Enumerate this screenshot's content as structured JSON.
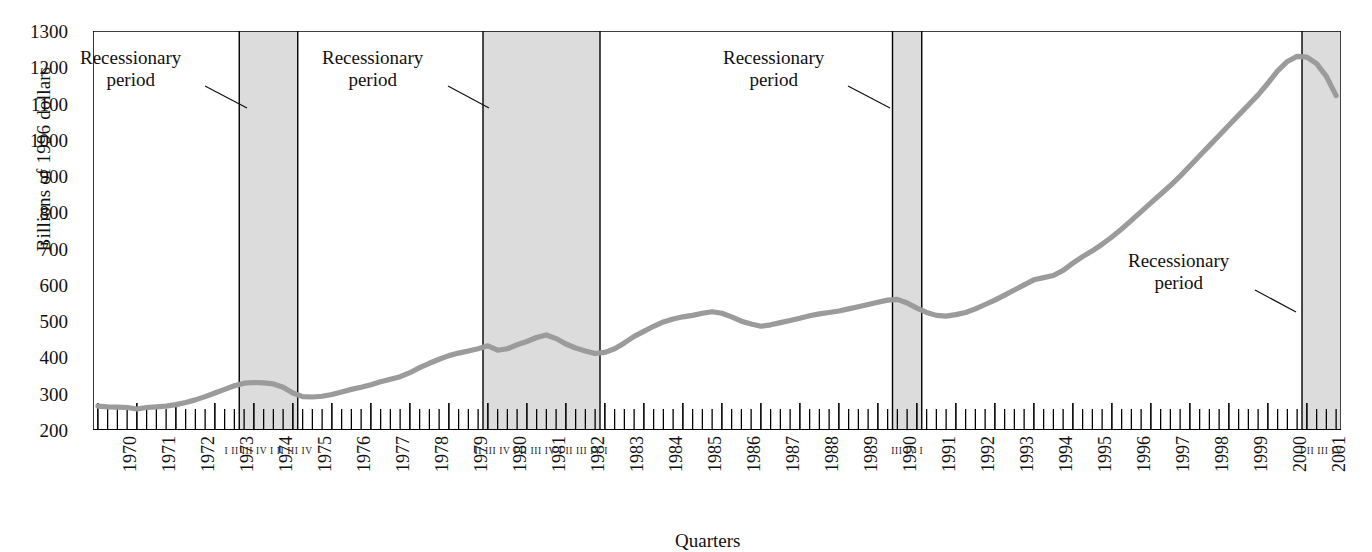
{
  "figure": {
    "cropped_header_text": "",
    "xlabel": "Quarters",
    "ylabel": "Billions of 1996 dollars"
  },
  "annotations": [
    {
      "id": "a1",
      "line1": "Recessionary",
      "line2": "period"
    },
    {
      "id": "a2",
      "line1": "Recessionary",
      "line2": "period"
    },
    {
      "id": "a3",
      "line1": "Recessionary",
      "line2": "period"
    },
    {
      "id": "a4",
      "line1": "Recessionary",
      "line2": "period"
    }
  ],
  "recession_quarter_labels": [
    {
      "id": "r1",
      "text": "I II III IV I II III IV"
    },
    {
      "id": "r2",
      "text": "II III IV I II III IV I II III IV I"
    },
    {
      "id": "r3",
      "text": "III IV I"
    },
    {
      "id": "r4",
      "text": "I II III IV"
    }
  ],
  "chart_data": {
    "type": "line",
    "title": "",
    "xlabel": "Quarters",
    "ylabel": "Billions of 1996 dollars",
    "ylim": [
      200,
      1300
    ],
    "yticks": [
      1300,
      1200,
      1100,
      1000,
      900,
      800,
      700,
      600,
      500,
      400,
      300,
      200
    ],
    "grid": false,
    "legend": "none",
    "xlim": [
      "1970 Q1",
      "2001 Q4"
    ],
    "x_tick_labels": [
      "1970",
      "1971",
      "1972",
      "1973",
      "1974",
      "1975",
      "1976",
      "1977",
      "1978",
      "1979",
      "1980",
      "1981",
      "1982",
      "1983",
      "1984",
      "1985",
      "1986",
      "1987",
      "1988",
      "1989",
      "1990",
      "1991",
      "1992",
      "1993",
      "1994",
      "1995",
      "1996",
      "1997",
      "1998",
      "1999",
      "2000",
      "2001"
    ],
    "minor_ticks": "quarterly",
    "series": [
      {
        "name": "Real investment",
        "color": "#9b9b9b",
        "x": [
          "1970Q1",
          "1970Q2",
          "1970Q3",
          "1970Q4",
          "1971Q1",
          "1971Q2",
          "1971Q3",
          "1971Q4",
          "1972Q1",
          "1972Q2",
          "1972Q3",
          "1972Q4",
          "1973Q1",
          "1973Q2",
          "1973Q3",
          "1973Q4",
          "1974Q1",
          "1974Q2",
          "1974Q3",
          "1974Q4",
          "1975Q1",
          "1975Q2",
          "1975Q3",
          "1975Q4",
          "1976Q1",
          "1976Q2",
          "1976Q3",
          "1976Q4",
          "1977Q1",
          "1977Q2",
          "1977Q3",
          "1977Q4",
          "1978Q1",
          "1978Q2",
          "1978Q3",
          "1978Q4",
          "1979Q1",
          "1979Q2",
          "1979Q3",
          "1979Q4",
          "1980Q1",
          "1980Q2",
          "1980Q3",
          "1980Q4",
          "1981Q1",
          "1981Q2",
          "1981Q3",
          "1981Q4",
          "1982Q1",
          "1982Q2",
          "1982Q3",
          "1982Q4",
          "1983Q1",
          "1983Q2",
          "1983Q3",
          "1983Q4",
          "1984Q1",
          "1984Q2",
          "1984Q3",
          "1984Q4",
          "1985Q1",
          "1985Q2",
          "1985Q3",
          "1985Q4",
          "1986Q1",
          "1986Q2",
          "1986Q3",
          "1986Q4",
          "1987Q1",
          "1987Q2",
          "1987Q3",
          "1987Q4",
          "1988Q1",
          "1988Q2",
          "1988Q3",
          "1988Q4",
          "1989Q1",
          "1989Q2",
          "1989Q3",
          "1989Q4",
          "1990Q1",
          "1990Q2",
          "1990Q3",
          "1990Q4",
          "1991Q1",
          "1991Q2",
          "1991Q3",
          "1991Q4",
          "1992Q1",
          "1992Q2",
          "1992Q3",
          "1992Q4",
          "1993Q1",
          "1993Q2",
          "1993Q3",
          "1993Q4",
          "1994Q1",
          "1994Q2",
          "1994Q3",
          "1994Q4",
          "1995Q1",
          "1995Q2",
          "1995Q3",
          "1995Q4",
          "1996Q1",
          "1996Q2",
          "1996Q3",
          "1996Q4",
          "1997Q1",
          "1997Q2",
          "1997Q3",
          "1997Q4",
          "1998Q1",
          "1998Q2",
          "1998Q3",
          "1998Q4",
          "1999Q1",
          "1999Q2",
          "1999Q3",
          "1999Q4",
          "2000Q1",
          "2000Q2",
          "2000Q3",
          "2000Q4",
          "2001Q1",
          "2001Q2",
          "2001Q3",
          "2001Q4"
        ],
        "values": [
          266,
          264,
          263,
          262,
          258,
          262,
          264,
          266,
          270,
          276,
          283,
          292,
          302,
          312,
          322,
          329,
          331,
          330,
          327,
          318,
          302,
          292,
          291,
          293,
          298,
          305,
          312,
          318,
          325,
          333,
          340,
          347,
          358,
          372,
          384,
          395,
          405,
          412,
          418,
          424,
          432,
          420,
          424,
          435,
          444,
          455,
          462,
          452,
          437,
          426,
          418,
          411,
          414,
          424,
          440,
          458,
          472,
          486,
          498,
          506,
          512,
          516,
          522,
          526,
          522,
          512,
          500,
          492,
          486,
          490,
          496,
          502,
          508,
          515,
          520,
          524,
          528,
          534,
          540,
          546,
          552,
          558,
          560,
          550,
          536,
          524,
          516,
          514,
          518,
          524,
          534,
          546,
          558,
          572,
          586,
          600,
          614,
          620,
          626,
          640,
          660,
          678,
          694,
          712,
          732,
          754,
          778,
          802,
          826,
          850,
          874,
          900,
          928,
          956,
          984,
          1012,
          1040,
          1068,
          1096,
          1124,
          1156,
          1190,
          1216,
          1230,
          1228,
          1210,
          1175,
          1122
        ]
      }
    ],
    "recession_bands": [
      {
        "start": "1973Q4",
        "end": "1975Q1",
        "color": "#dcdcdc"
      },
      {
        "start": "1980Q1",
        "end": "1982Q4",
        "color": "#dcdcdc"
      },
      {
        "start": "1990Q3",
        "end": "1991Q1",
        "color": "#dcdcdc"
      },
      {
        "start": "2001Q1",
        "end": "2001Q4",
        "color": "#dcdcdc"
      }
    ]
  }
}
